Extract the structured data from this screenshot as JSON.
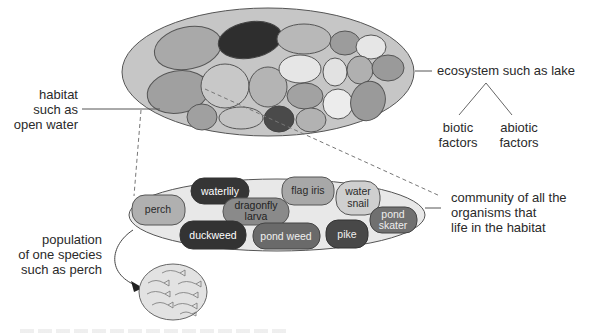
{
  "ecosystem": {
    "label": "ecosystem such as lake",
    "factors": [
      {
        "line1": "biotic",
        "line2": "factors"
      },
      {
        "line1": "abiotic",
        "line2": "factors"
      }
    ]
  },
  "habitat": {
    "lines": [
      "habitat",
      "such as",
      "open water"
    ]
  },
  "community": {
    "lines": [
      "community of all the",
      "organisms that",
      "life in the habitat"
    ],
    "organisms": [
      {
        "line1": "waterlily",
        "line2": ""
      },
      {
        "line1": "flag iris",
        "line2": ""
      },
      {
        "line1": "water",
        "line2": "snail"
      },
      {
        "line1": "perch",
        "line2": ""
      },
      {
        "line1": "dragonfly",
        "line2": "larva"
      },
      {
        "line1": "pond",
        "line2": "skater"
      },
      {
        "line1": "duckweed",
        "line2": ""
      },
      {
        "line1": "pond weed",
        "line2": ""
      },
      {
        "line1": "pike",
        "line2": ""
      }
    ]
  },
  "population": {
    "lines": [
      "population",
      "of one species",
      "such as perch"
    ]
  },
  "colors": {
    "outer_fill": "#c4c4c4",
    "community_fill": "#e6e6e6",
    "dark": "#3a3a3a",
    "mid_dark": "#6e6e6e",
    "mid": "#9a9a9a",
    "light": "#b9b9b9",
    "very_light": "#e8e8e8"
  }
}
